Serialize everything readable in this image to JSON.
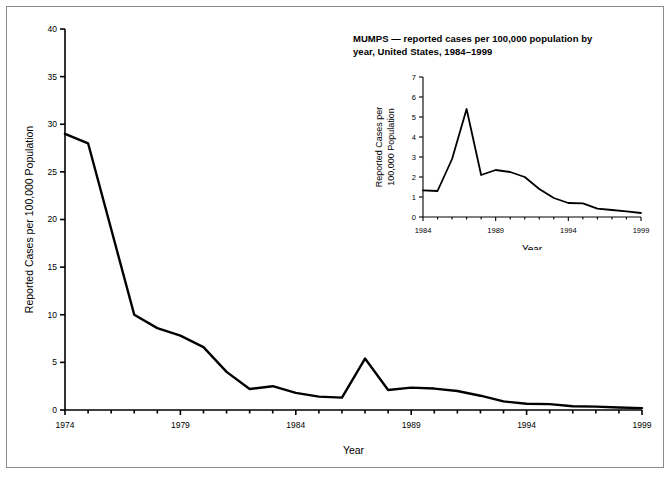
{
  "figure": {
    "border_color": "#8a8a8a",
    "background": "#ffffff",
    "line_color": "#000000"
  },
  "inset_title": "MUMPS — reported cases per 100,000 population by year, United States, 1984–1999",
  "main_chart": {
    "ylabel": "Reported Cases per 100,000 Population",
    "xlabel": "Year",
    "xtick_labels": [
      "1974",
      "1979",
      "1984",
      "1989",
      "1994",
      "1999"
    ],
    "ytick_labels": [
      "0",
      "5",
      "10",
      "15",
      "20",
      "25",
      "30",
      "35",
      "40"
    ]
  },
  "inset_chart": {
    "ylabel_line1": "Reported Cases per",
    "ylabel_line2": "100,000 Population",
    "xlabel": "Year",
    "xtick_labels": [
      "1984",
      "1989",
      "1994",
      "1999"
    ],
    "ytick_labels": [
      "0",
      "1",
      "2",
      "3",
      "4",
      "5",
      "6",
      "7"
    ]
  },
  "chart_data": [
    {
      "type": "line",
      "name": "main",
      "title": "",
      "xlabel": "Year",
      "ylabel": "Reported Cases per 100,000 Population",
      "xlim": [
        1974,
        1999
      ],
      "ylim": [
        0,
        40
      ],
      "xticks": [
        1974,
        1979,
        1984,
        1989,
        1994,
        1999
      ],
      "yticks": [
        0,
        5,
        10,
        15,
        20,
        25,
        30,
        35,
        40
      ],
      "grid": false,
      "legend": "none",
      "x": [
        1974,
        1975,
        1976,
        1977,
        1978,
        1979,
        1980,
        1981,
        1982,
        1983,
        1984,
        1985,
        1986,
        1987,
        1988,
        1989,
        1990,
        1991,
        1992,
        1993,
        1994,
        1995,
        1996,
        1997,
        1998,
        1999
      ],
      "values": [
        29.0,
        28.0,
        19.0,
        10.0,
        8.6,
        7.8,
        6.6,
        4.0,
        2.2,
        2.5,
        1.8,
        1.4,
        1.3,
        5.4,
        2.1,
        2.35,
        2.25,
        2.0,
        1.5,
        0.9,
        0.65,
        0.62,
        0.4,
        0.35,
        0.27,
        0.2
      ],
      "ylabel_units": "cases per 100,000 population"
    },
    {
      "type": "line",
      "name": "inset",
      "title": "MUMPS — reported cases per 100,000 population by year, United States, 1984–1999",
      "xlabel": "Year",
      "ylabel": "Reported Cases per 100,000 Population",
      "xlim": [
        1984,
        1999
      ],
      "ylim": [
        0,
        7
      ],
      "xticks": [
        1984,
        1989,
        1994,
        1999
      ],
      "yticks": [
        0,
        1,
        2,
        3,
        4,
        5,
        6,
        7
      ],
      "grid": false,
      "legend": "none",
      "x": [
        1984,
        1985,
        1986,
        1987,
        1988,
        1989,
        1990,
        1991,
        1992,
        1993,
        1994,
        1995,
        1996,
        1997,
        1998,
        1999
      ],
      "values": [
        1.33,
        1.3,
        2.9,
        5.4,
        2.1,
        2.35,
        2.25,
        2.0,
        1.4,
        0.95,
        0.7,
        0.68,
        0.42,
        0.35,
        0.28,
        0.2
      ]
    }
  ]
}
